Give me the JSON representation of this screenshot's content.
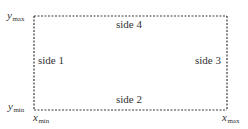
{
  "diagram": {
    "type": "boundary-rectangle",
    "rect": {
      "x": 34,
      "y": 16,
      "width": 193,
      "height": 94
    },
    "border_color": "#3a3a3a",
    "border_style": "dashed",
    "sides": [
      {
        "id": "side1",
        "label": "side 1",
        "position": "left"
      },
      {
        "id": "side2",
        "label": "side 2",
        "position": "bottom"
      },
      {
        "id": "side3",
        "label": "side 3",
        "position": "right"
      },
      {
        "id": "side4",
        "label": "side 4",
        "position": "top"
      }
    ],
    "corner_labels": {
      "y_max": {
        "var": "y",
        "sub": "max"
      },
      "y_min": {
        "var": "y",
        "sub": "min"
      },
      "x_min": {
        "var": "x",
        "sub": "min"
      },
      "x_max": {
        "var": "x",
        "sub": "max"
      }
    }
  }
}
